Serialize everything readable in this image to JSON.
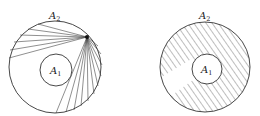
{
  "figure": {
    "left_panel": {
      "outer_label": "A",
      "outer_sub": "2",
      "inner_label": "A",
      "inner_sub": "1",
      "outer": {
        "cx": 55,
        "cy": 67,
        "r": 46
      },
      "inner": {
        "cx": 56,
        "cy": 70,
        "r": 16
      },
      "focus": {
        "x": 87,
        "y": 37
      },
      "ray_endpoints": [
        [
          38,
          24
        ],
        [
          28,
          29
        ],
        [
          20,
          35
        ],
        [
          14,
          42
        ],
        [
          10,
          50
        ],
        [
          9,
          58
        ],
        [
          56,
          113
        ],
        [
          66,
          112
        ],
        [
          74,
          110
        ],
        [
          81,
          106
        ],
        [
          88,
          101
        ],
        [
          94,
          94
        ],
        [
          98,
          86
        ],
        [
          101,
          76
        ],
        [
          102,
          65
        ],
        [
          101,
          54
        ],
        [
          98,
          46
        ]
      ]
    },
    "right_panel": {
      "outer_label": "A",
      "outer_sub": "2",
      "inner_label": "A",
      "inner_sub": "1",
      "outer": {
        "cx": 205,
        "cy": 67,
        "r": 45
      },
      "inner": {
        "cx": 207,
        "cy": 69,
        "r": 15
      },
      "hatch": "diagonal"
    },
    "colors": {
      "stroke": "#333333",
      "background": "#ffffff"
    }
  }
}
